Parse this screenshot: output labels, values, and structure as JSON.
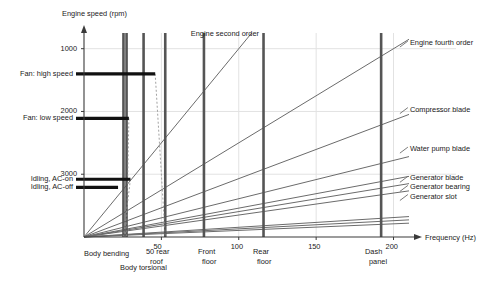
{
  "chart_data": {
    "type": "line",
    "title": "",
    "xlabel": "Frequency (Hz)",
    "ylabel": "Engine speed (rpm)",
    "xlim": [
      0,
      210
    ],
    "ylim": [
      0,
      3250
    ],
    "xticks": [
      50,
      100,
      150,
      200
    ],
    "yticks": [
      1000,
      2000,
      3000
    ],
    "grid": true,
    "order_lines": [
      {
        "name": "Engine second order",
        "label": "Engine second order",
        "slope_rpm_per_hz": 30.0,
        "label_x_hz": 69,
        "label_y_rpm": 3230
      },
      {
        "name": "Engine fourth order",
        "label": "Engine fourth order",
        "slope_rpm_per_hz": 15.0,
        "label_x_hz": 208,
        "label_y_rpm": 3090
      },
      {
        "name": "Compressor blade",
        "label": "Compressor blade",
        "slope_rpm_per_hz": 9.3,
        "label_x_hz": 208,
        "label_y_rpm": 2030
      },
      {
        "name": "Water pump blade",
        "label": "Water pump blade",
        "slope_rpm_per_hz": 6.1,
        "label_x_hz": 208,
        "label_y_rpm": 1400
      },
      {
        "name": "Generator blade",
        "label": "Generator blade",
        "slope_rpm_per_hz": 4.6,
        "label_x_hz": 208,
        "label_y_rpm": 935
      },
      {
        "name": "Generator bearing",
        "label": "Generator bearing",
        "slope_rpm_per_hz": 4.05,
        "label_x_hz": 208,
        "label_y_rpm": 790
      },
      {
        "name": "Generator slot",
        "label": "Generator slot",
        "slope_rpm_per_hz": 3.5,
        "label_x_hz": 208,
        "label_y_rpm": 645
      },
      {
        "name": "low-order-ray-1",
        "label": "",
        "slope_rpm_per_hz": 1.55,
        "label_x_hz": 0,
        "label_y_rpm": 0
      },
      {
        "name": "low-order-ray-2",
        "label": "",
        "slope_rpm_per_hz": 1.3,
        "label_x_hz": 0,
        "label_y_rpm": 0
      },
      {
        "name": "low-order-ray-3",
        "label": "",
        "slope_rpm_per_hz": 1.05,
        "label_x_hz": 0,
        "label_y_rpm": 0
      }
    ],
    "structural_modes": [
      {
        "name": "Body bending",
        "label": "Body bending",
        "freq_hz": 25.5,
        "top_rpm": 3250,
        "label_line1": "Body bending",
        "label_line2": ""
      },
      {
        "name": "Body bending2",
        "label": "",
        "freq_hz": 27.5,
        "top_rpm": 3250,
        "label_line1": "",
        "label_line2": ""
      },
      {
        "name": "Body torsional",
        "label": "Body torsional",
        "freq_hz": 38.5,
        "top_rpm": 3250,
        "label_line1": "Body torsional",
        "label_line2": ""
      },
      {
        "name": "50 rear roof",
        "label": "50 rear roof",
        "freq_hz": 52.5,
        "top_rpm": 3250,
        "label_line1": "50 rear",
        "label_line2": "roof"
      },
      {
        "name": "Front floor",
        "label": "Front floor",
        "freq_hz": 77.5,
        "top_rpm": 3250,
        "label_line1": "Front",
        "label_line2": "floor"
      },
      {
        "name": "Rear floor",
        "label": "Rear floor",
        "freq_hz": 116,
        "top_rpm": 3250,
        "label_line1": "Rear",
        "label_line2": "floor"
      },
      {
        "name": "Dash panel",
        "label": "Dash panel",
        "freq_hz": 192,
        "top_rpm": 3250,
        "label_line1": "Dash",
        "label_line2": "panel"
      }
    ],
    "operating_speeds": [
      {
        "name": "Fan: high speed",
        "label": "Fan: high speed",
        "rpm": 2600,
        "start_hz": 0,
        "end_hz": 46
      },
      {
        "name": "Fan: low speed",
        "label": "Fan: low speed",
        "rpm": 1890,
        "start_hz": 0,
        "end_hz": 29
      },
      {
        "name": "Idling, AC-on",
        "label": "Idling, AC-on",
        "rpm": 920,
        "start_hz": 0,
        "end_hz": 30
      },
      {
        "name": "Idling, AC-off",
        "label": "Idling, AC-off",
        "rpm": 790,
        "start_hz": 0,
        "end_hz": 22
      }
    ],
    "coincidence_leaders": [
      {
        "name": "leader-fan-high-to-50-rear-roof",
        "from_hz": 46,
        "from_rpm": 2600,
        "to_hz": 52.5,
        "to_rpm": 0
      },
      {
        "name": "leader-fan-low-to-body-bending",
        "from_hz": 29,
        "from_rpm": 1890,
        "to_hz": 27.5,
        "to_rpm": 0
      },
      {
        "name": "leader-idling-to-body-torsional",
        "from_hz": 30,
        "from_rpm": 920,
        "to_hz": 25.5,
        "to_rpm": 0
      }
    ]
  },
  "axes": {
    "y_title": "Engine speed (rpm)",
    "x_title": "Frequency (Hz)",
    "y_tick_labels": [
      "3000",
      "2000",
      "1000"
    ],
    "x_tick_labels": [
      "50",
      "100",
      "150",
      "200"
    ]
  },
  "colors": {
    "bar": "#555555",
    "ray": "#6b6b6b",
    "speed_bar": "#111111",
    "grid": "#e2e2e2",
    "axis": "#3a3a3a",
    "text": "#1a1a1a"
  }
}
